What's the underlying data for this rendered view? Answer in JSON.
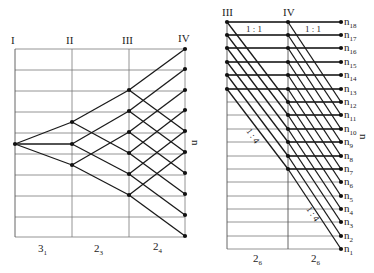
{
  "left_panel": {
    "column_labels": [
      "I",
      "II",
      "III",
      "IV"
    ],
    "axis_label": "n",
    "group_labels": [
      {
        "base": "3",
        "sub": "1"
      },
      {
        "base": "2",
        "sub": "3"
      },
      {
        "base": "2",
        "sub": "4"
      }
    ],
    "columns_x": [
      15,
      72,
      129,
      185
    ],
    "top": 49,
    "bottom": 237,
    "h_lines": [
      49,
      70,
      91,
      112,
      133,
      154,
      175,
      196,
      217,
      237
    ],
    "node_I": [
      [
        15,
        144
      ]
    ],
    "nodes_II": [
      122,
      144,
      165
    ],
    "nodes_III": [
      90,
      111,
      132,
      153,
      174,
      195
    ],
    "nodes_IV": [
      49,
      69,
      90,
      110,
      131,
      152,
      173,
      194,
      215,
      236
    ]
  },
  "right_panel": {
    "column_labels": [
      "III",
      "IV"
    ],
    "axis_label": "n",
    "ratio_labels": [
      "1 : 1",
      "1 : 1",
      "1 : 4",
      "1 : 4"
    ],
    "group_labels": [
      {
        "base": "2",
        "sub": "6"
      },
      {
        "base": "2",
        "sub": "6"
      }
    ],
    "speed_labels": [
      "n18",
      "n17",
      "n16",
      "n15",
      "n14",
      "n13",
      "n12",
      "n11",
      "n10",
      "n9",
      "n8",
      "n7",
      "n6",
      "n5",
      "n4",
      "n3",
      "n2",
      "n1"
    ],
    "x_III": 227,
    "x_IV": 288,
    "x_right": 341,
    "top": 22,
    "bottom": 249,
    "levels_y": [
      22,
      35,
      48,
      62,
      75,
      89,
      102,
      115,
      129,
      142,
      156,
      169,
      182,
      196,
      209,
      222,
      236,
      249
    ],
    "nodes_III_count": 6,
    "nodes_IV_count": 12,
    "shift": 6
  }
}
